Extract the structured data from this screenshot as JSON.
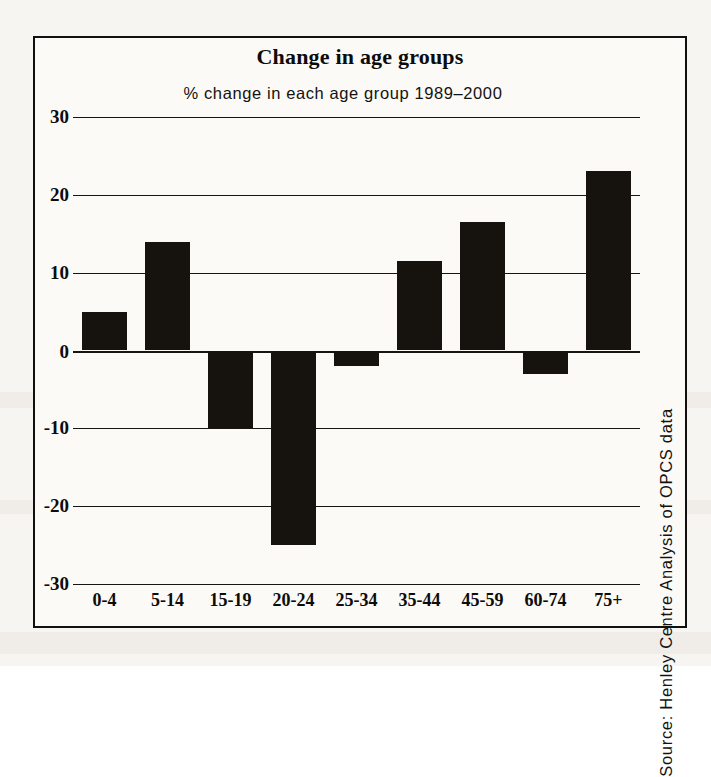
{
  "figure": {
    "title": "Change in age groups",
    "subtitle": "% change in each age group 1989–2000",
    "source": "Source: Henley Centre Analysis of OPCS data",
    "frame_color": "#12100e",
    "bar_color": "#16130f",
    "background_color": "#fbfaf7"
  },
  "chart_data": {
    "type": "bar",
    "title": "Change in age groups",
    "subtitle": "% change in each age group 1989–2000",
    "xlabel": "",
    "ylabel": "",
    "ylim": [
      -30,
      30
    ],
    "yticks": [
      30,
      20,
      10,
      0,
      -10,
      -20,
      -30
    ],
    "ytick_labels": [
      "30",
      "20",
      "10",
      "0",
      "-10",
      "-20",
      "-30"
    ],
    "grid": true,
    "legend": "none",
    "orientation": "vertical",
    "categories": [
      "0-4",
      "5-14",
      "15-19",
      "20-24",
      "25-34",
      "35-44",
      "45-59",
      "60-74",
      "75+"
    ],
    "values": [
      5,
      14,
      -10,
      -25,
      -2,
      11.5,
      16.5,
      -3,
      23
    ],
    "annotations": [
      "Source: Henley Centre Analysis of OPCS data"
    ]
  }
}
